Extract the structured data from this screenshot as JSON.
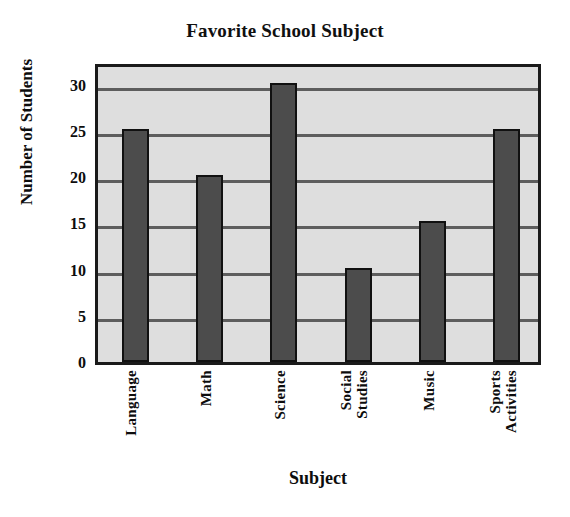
{
  "chart_data": {
    "type": "bar",
    "title": "Favorite School Subject",
    "xlabel": "Subject",
    "ylabel": "Number of Students",
    "categories": [
      "Language",
      "Math",
      "Science",
      "Social Studies",
      "Music",
      "Sports Activities"
    ],
    "category_lines": [
      [
        "Language"
      ],
      [
        "Math"
      ],
      [
        "Science"
      ],
      [
        "Social",
        "Studies"
      ],
      [
        "Music"
      ],
      [
        "Sports",
        "Activities"
      ]
    ],
    "values": [
      25,
      20,
      30,
      10,
      15,
      25
    ],
    "ylim": [
      0,
      32
    ],
    "yticks": [
      0,
      5,
      10,
      15,
      20,
      25,
      30
    ],
    "ytick_labels": [
      "0",
      "5",
      "10",
      "15",
      "20",
      "25",
      "30"
    ],
    "grid": true,
    "grid_axis": "y",
    "legend": false,
    "colors": {
      "bar_fill": "#4c4c4c",
      "bar_edge": "#111111",
      "plot_background": "#dedede",
      "grid_line": "#5d5d5d",
      "axis_border": "#1a1a1a",
      "text": "#0d0d0d",
      "page_background": "#ffffff"
    }
  }
}
